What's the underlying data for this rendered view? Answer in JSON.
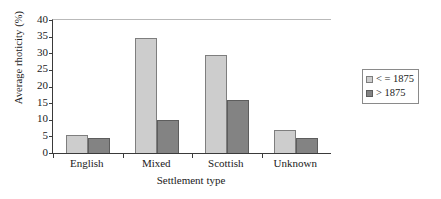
{
  "chart_data": {
    "type": "bar",
    "title": "",
    "xlabel": "Settlement type",
    "ylabel": "Average rhoticity (%)",
    "categories": [
      "English",
      "Mixed",
      "Scottish",
      "Unknown"
    ],
    "series": [
      {
        "name": "< = 1875",
        "values": [
          5.5,
          34.5,
          29.5,
          7.0
        ],
        "color": "#cdcdcd"
      },
      {
        "name": "> 1875",
        "values": [
          4.5,
          10.0,
          16.0,
          4.5
        ],
        "color": "#838383"
      }
    ],
    "ylim": [
      0,
      40
    ],
    "yticks": [
      0,
      5,
      10,
      15,
      20,
      25,
      30,
      35,
      40
    ],
    "ytick_labels": [
      "0",
      "5",
      "10",
      "15",
      "20",
      "25",
      "30",
      "35",
      "40"
    ],
    "grid": false,
    "legend_position": "right",
    "legend_entries": [
      "< = 1875",
      "> 1875"
    ]
  }
}
